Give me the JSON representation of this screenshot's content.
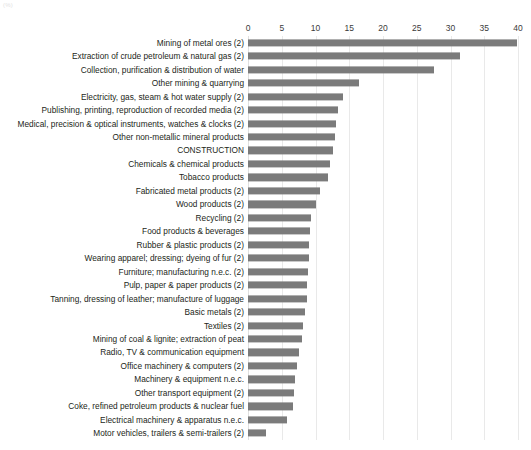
{
  "corner_note": "(%)",
  "chart_data": {
    "type": "bar",
    "orientation": "horizontal",
    "title": "",
    "subtitle": "",
    "xlabel": "",
    "ylabel": "",
    "xlim": [
      0,
      40
    ],
    "xticks": [
      0,
      5,
      10,
      15,
      20,
      25,
      30,
      35,
      40
    ],
    "xtick_labels": [
      "0",
      "5",
      "10",
      "15",
      "20",
      "25",
      "30",
      "35",
      "40"
    ],
    "grid": true,
    "legend": false,
    "bar_color": "#7b7b7b",
    "gridline_color": "#e9e9e9",
    "categories": [
      "Mining of metal ores (2)",
      "Extraction of crude petroleum & natural gas (2)",
      "Collection, purification & distribution of water",
      "Other mining & quarrying",
      "Electricity, gas, steam & hot water supply (2)",
      "Publishing, printing, reproduction of recorded media (2)",
      "Medical, precision & optical instruments, watches & clocks (2)",
      "Other non-metallic mineral products",
      "CONSTRUCTION",
      "Chemicals & chemical products",
      "Tobacco products",
      "Fabricated metal products (2)",
      "Wood products (2)",
      "Recycling (2)",
      "Food products & beverages",
      "Rubber & plastic products (2)",
      "Wearing apparel; dressing; dyeing of fur (2)",
      "Furniture; manufacturing n.e.c. (2)",
      "Pulp, paper & paper products (2)",
      "Tanning, dressing of leather; manufacture of luggage",
      "Basic metals (2)",
      "Textiles (2)",
      "Mining of coal & lignite; extraction of peat",
      "Radio, TV & communication equipment",
      "Office machinery & computers (2)",
      "Machinery & equipment n.e.c.",
      "Other transport equipment (2)",
      "Coke, refined petroleum products & nuclear fuel",
      "Electrical machinery & apparatus n.e.c.",
      "Motor vehicles, trailers & semi-trailers (2)"
    ],
    "values": [
      39.9,
      31.4,
      27.5,
      16.4,
      14.0,
      13.4,
      13.1,
      12.9,
      12.6,
      12.2,
      11.8,
      10.6,
      10.0,
      9.4,
      9.2,
      9.1,
      9.0,
      8.9,
      8.8,
      8.7,
      8.4,
      8.2,
      8.0,
      7.6,
      7.2,
      7.0,
      6.8,
      6.6,
      5.8,
      2.6
    ]
  }
}
